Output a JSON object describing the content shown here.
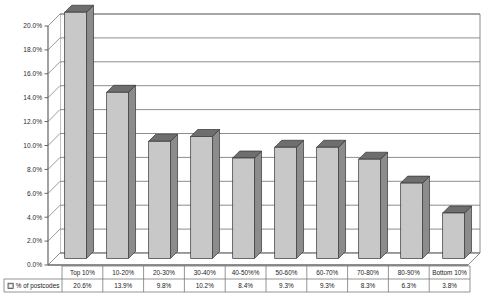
{
  "chart_data": {
    "type": "bar",
    "title": "",
    "subtitle": "",
    "xlabel": "",
    "ylabel": "",
    "grid": true,
    "three_d": true,
    "legend_position": "bottom-left-table",
    "ylim": [
      0,
      20
    ],
    "y_tick_labels": [
      "0.0%",
      "2.0%",
      "4.0%",
      "6.0%",
      "8.0%",
      "10.0%",
      "12.0%",
      "14.0%",
      "16.0%",
      "18.0%",
      "20.0%"
    ],
    "y_tick_values": [
      0,
      2,
      4,
      6,
      8,
      10,
      12,
      14,
      16,
      18,
      20
    ],
    "categories": [
      "Top 10%",
      "10-20%",
      "20-30%",
      "30-40%",
      "40-50%%",
      "50-60%",
      "60-70%",
      "70-80%",
      "80-90%",
      "Bottom 10%"
    ],
    "series": [
      {
        "name": "% of postcodes",
        "values": [
          20.6,
          13.9,
          9.8,
          10.2,
          8.4,
          9.3,
          9.3,
          8.3,
          6.3,
          3.8
        ],
        "value_labels": [
          "20.6%",
          "13.9%",
          "9.8%",
          "10.2%",
          "8.4%",
          "9.3%",
          "9.3%",
          "8.3%",
          "6.3%",
          "3.8%"
        ],
        "color": "#c8c8c8",
        "top_color": "#6e6e6e",
        "side_color": "#8c8c8c",
        "outline_color": "#333333"
      }
    ]
  },
  "legend": {
    "marker_name": "legend-swatch",
    "label": "% of postcodes"
  },
  "colors": {
    "plot_background": "#ffffff",
    "gridline": "#808080",
    "axis_line": "#555555",
    "table_border": "#7a7a7a",
    "bar_front": "#c8c8c8",
    "bar_top": "#6e6e6e",
    "bar_side": "#8c8c8c"
  }
}
